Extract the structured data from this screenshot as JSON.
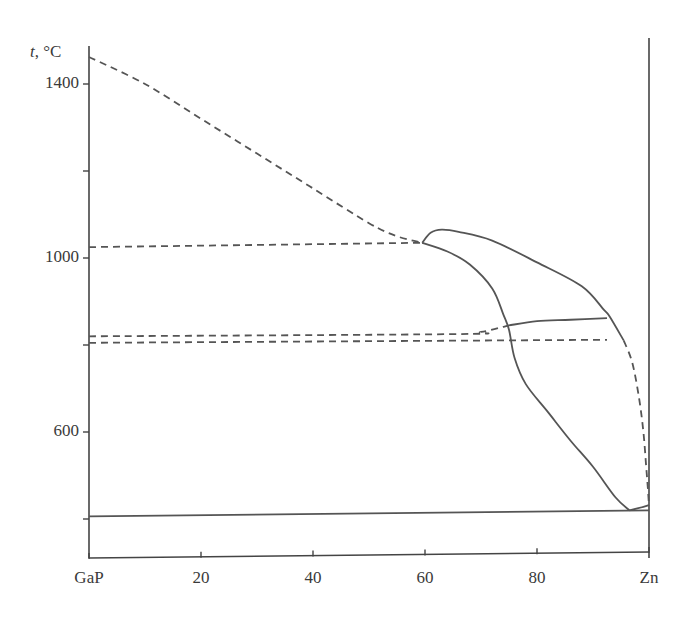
{
  "chart_data": {
    "type": "line",
    "title": "",
    "xlabel": "",
    "ylabel": "t, °C",
    "ylabel_var": "t",
    "ylabel_unit": ", °C",
    "xlim": [
      0,
      100
    ],
    "ylim": [
      300,
      1487
    ],
    "x_ticks": [
      0,
      20,
      40,
      60,
      80,
      100
    ],
    "x_tick_labels": [
      "GaP",
      "20",
      "40",
      "60",
      "80",
      "Zn"
    ],
    "y_ticks": [
      400,
      600,
      800,
      1000,
      1200,
      1400
    ],
    "y_tick_labels": [
      "",
      "600",
      "",
      "1000",
      "",
      "1400"
    ],
    "grid": false,
    "legend": null,
    "line_color": "#555555",
    "series": [
      {
        "name": "liquidus-GaP-side",
        "style": "dashed",
        "points": [
          [
            0,
            1462
          ],
          [
            10,
            1400
          ],
          [
            20,
            1320
          ],
          [
            30,
            1240
          ],
          [
            40,
            1160
          ],
          [
            50,
            1080
          ],
          [
            55,
            1050
          ],
          [
            59.5,
            1035
          ]
        ]
      },
      {
        "name": "metastable-horizontal-1035",
        "style": "dashed",
        "points": [
          [
            0,
            1025
          ],
          [
            59.5,
            1035
          ]
        ]
      },
      {
        "name": "metastable-horizontal-820",
        "style": "dashed",
        "points": [
          [
            0,
            820
          ],
          [
            65,
            825
          ],
          [
            70,
            830
          ],
          [
            75,
            845
          ]
        ]
      },
      {
        "name": "metastable-horizontal-805",
        "style": "dashed",
        "points": [
          [
            0,
            805
          ],
          [
            92.5,
            812
          ]
        ]
      },
      {
        "name": "upper-dome",
        "style": "solid",
        "points": [
          [
            59.5,
            1035
          ],
          [
            61,
            1058
          ],
          [
            63,
            1065
          ],
          [
            66,
            1060
          ],
          [
            72,
            1040
          ],
          [
            80,
            990
          ],
          [
            88,
            935
          ],
          [
            92,
            880
          ],
          [
            93,
            865
          ],
          [
            95.5,
            810
          ]
        ]
      },
      {
        "name": "lower-dome-and-solvus",
        "style": "solid",
        "points": [
          [
            59.5,
            1035
          ],
          [
            64,
            1015
          ],
          [
            68,
            985
          ],
          [
            72,
            930
          ],
          [
            74,
            870
          ],
          [
            75,
            835
          ],
          [
            76,
            770
          ],
          [
            78,
            710
          ],
          [
            82,
            645
          ],
          [
            86,
            580
          ],
          [
            90,
            520
          ],
          [
            94,
            450
          ],
          [
            96.5,
            420
          ]
        ]
      },
      {
        "name": "tie-line-850",
        "style": "solid",
        "points": [
          [
            75,
            845
          ],
          [
            80,
            855
          ],
          [
            86,
            858
          ],
          [
            92.5,
            862
          ]
        ]
      },
      {
        "name": "liquidus-Zn-side",
        "style": "dashed",
        "points": [
          [
            95.5,
            810
          ],
          [
            97,
            760
          ],
          [
            98.2,
            680
          ],
          [
            99,
            600
          ],
          [
            99.5,
            520
          ],
          [
            99.8,
            470
          ],
          [
            100,
            430
          ]
        ]
      },
      {
        "name": "eutectic-near-Zn",
        "style": "solid",
        "points": [
          [
            96.5,
            420
          ],
          [
            99,
            428
          ],
          [
            100,
            432
          ]
        ]
      },
      {
        "name": "eutectic-horizontal-420",
        "style": "solid",
        "points": [
          [
            0,
            406
          ],
          [
            100,
            420
          ]
        ]
      }
    ]
  }
}
